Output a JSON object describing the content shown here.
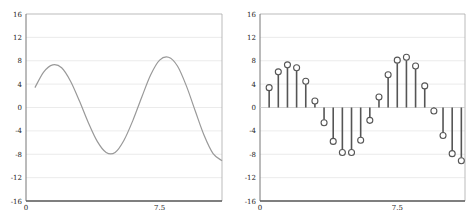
{
  "chart_data": [
    {
      "type": "line",
      "title": "",
      "xlabel": "",
      "ylabel": "",
      "xlim": [
        0,
        11
      ],
      "ylim": [
        -16,
        16
      ],
      "grid": "horizontal",
      "x_ticks": [
        "0",
        "7.5"
      ],
      "y_ticks": [
        "16",
        "12",
        "8",
        "4",
        "0",
        "-4",
        "-8",
        "-12",
        "-16"
      ],
      "x": [
        0.5,
        1.0,
        1.5,
        2.0,
        2.5,
        3.0,
        3.5,
        4.0,
        4.5,
        5.0,
        5.5,
        6.0,
        6.5,
        7.0,
        7.5,
        8.0,
        8.5,
        9.0,
        9.5,
        10.0,
        10.5,
        11.0
      ],
      "values": [
        3.4,
        6.1,
        7.3,
        6.8,
        4.5,
        1.1,
        -2.6,
        -5.8,
        -7.7,
        -7.7,
        -5.6,
        -2.2,
        1.8,
        5.6,
        8.1,
        8.6,
        7.1,
        3.7,
        -0.6,
        -4.8,
        -7.9,
        -9.1
      ],
      "color": "#999999"
    },
    {
      "type": "stem",
      "title": "",
      "xlabel": "",
      "ylabel": "",
      "xlim": [
        0,
        11.2
      ],
      "ylim": [
        -16,
        16
      ],
      "grid": "horizontal",
      "x_ticks": [
        "0",
        "7.5"
      ],
      "y_ticks": [
        "16",
        "12",
        "8",
        "4",
        "0",
        "-4",
        "-8",
        "-12",
        "-16"
      ],
      "x": [
        0.5,
        1.0,
        1.5,
        2.0,
        2.5,
        3.0,
        3.5,
        4.0,
        4.5,
        5.0,
        5.5,
        6.0,
        6.5,
        7.0,
        7.5,
        8.0,
        8.5,
        9.0,
        9.5,
        10.0,
        10.5,
        11.0
      ],
      "values": [
        3.4,
        6.1,
        7.3,
        6.8,
        4.5,
        1.1,
        -2.6,
        -5.8,
        -7.7,
        -7.7,
        -5.6,
        -2.2,
        1.8,
        5.6,
        8.1,
        8.6,
        7.1,
        3.7,
        -0.6,
        -4.8,
        -7.9,
        -9.1
      ],
      "color": "#555555"
    }
  ]
}
